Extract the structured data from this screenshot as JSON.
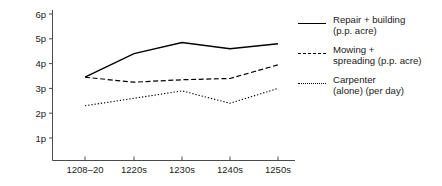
{
  "chart_data": {
    "type": "line",
    "title": "",
    "xlabel": "",
    "ylabel": "",
    "categories": [
      "1208–20",
      "1220s",
      "1230s",
      "1240s",
      "1250s"
    ],
    "x_tick_labels": [
      "1208–20",
      "1220s",
      "1230s",
      "1240s",
      "1250s"
    ],
    "y_tick_labels": [
      "1p",
      "2p",
      "3p",
      "4p",
      "5p",
      "6p"
    ],
    "y_tick_values": [
      1,
      2,
      3,
      4,
      5,
      6
    ],
    "ylim": [
      0,
      6
    ],
    "grid": false,
    "legend_position": "right",
    "series": [
      {
        "name": "Repair + building\n(p.p. acre)",
        "style": "solid",
        "color": "#000000",
        "values": [
          3.45,
          4.4,
          4.85,
          4.6,
          4.8
        ]
      },
      {
        "name": "Mowing +\nspreading (p.p. acre)",
        "style": "dashed",
        "color": "#000000",
        "values": [
          3.45,
          3.25,
          3.35,
          3.4,
          3.95
        ]
      },
      {
        "name": "Carpenter\n(alone) (per day)",
        "style": "dotted",
        "color": "#000000",
        "values": [
          2.3,
          2.6,
          2.9,
          2.4,
          3.0
        ]
      }
    ]
  },
  "legend": {
    "entries": [
      {
        "label": "Repair + building\n(p.p. acre)",
        "style": "solid"
      },
      {
        "label": "Mowing +\nspreading (p.p. acre)",
        "style": "dashed"
      },
      {
        "label": "Carpenter\n(alone) (per day)",
        "style": "dotted"
      }
    ]
  },
  "axes": {
    "y_axis_name": "price-axis",
    "x_axis_name": "period-axis"
  }
}
